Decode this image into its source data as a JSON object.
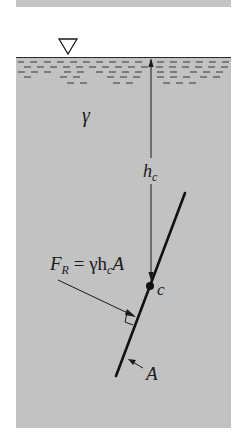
{
  "diagram": {
    "fluid_symbol": "γ",
    "depth_label": {
      "main": "h",
      "sub": "c"
    },
    "centroid_label": "c",
    "area_label": "A",
    "force_label": {
      "F": "F",
      "sub": "R",
      "eq": " = γh",
      "eq_sub": "c",
      "tail": "A"
    },
    "free_surface_symbol": "free-surface-triangle",
    "colors": {
      "fluid": "#c2c2c2",
      "strip": "#c4c4c4",
      "lines": "#1a1a1a",
      "dashes": "#6e6e6e"
    }
  }
}
